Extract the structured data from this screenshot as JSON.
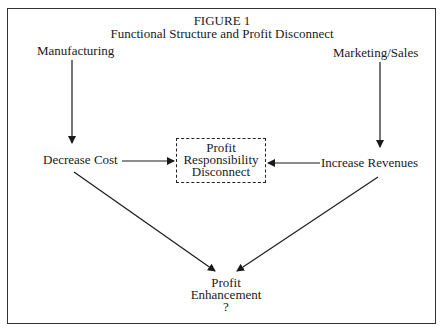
{
  "figure": {
    "label": "FIGURE 1",
    "title": "Functional Structure and Profit Disconnect"
  },
  "nodes": {
    "manufacturing": "Manufacturing",
    "marketing_sales": "Marketing/Sales",
    "decrease_cost": "Decrease Cost",
    "increase_revenues": "Increase Revenues",
    "disconnect": {
      "line1": "Profit",
      "line2": "Responsibility",
      "line3": "Disconnect"
    },
    "profit_enhancement": {
      "line1": "Profit",
      "line2": "Enhancement",
      "line3": "?"
    }
  },
  "edges": [
    {
      "from": "Manufacturing",
      "to": "Decrease Cost"
    },
    {
      "from": "Marketing/Sales",
      "to": "Increase Revenues"
    },
    {
      "from": "Decrease Cost",
      "to": "Profit Responsibility Disconnect"
    },
    {
      "from": "Increase Revenues",
      "to": "Profit Responsibility Disconnect"
    },
    {
      "from": "Decrease Cost",
      "to": "Profit Enhancement ?"
    },
    {
      "from": "Increase Revenues",
      "to": "Profit Enhancement ?"
    }
  ]
}
